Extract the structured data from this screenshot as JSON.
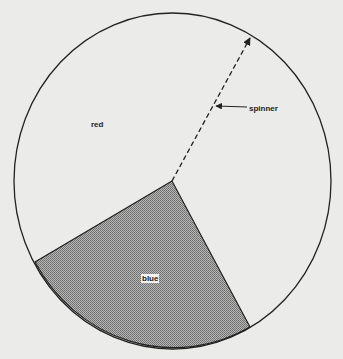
{
  "diagram": {
    "type": "spinner",
    "labels": {
      "red": "red",
      "blue": "blue",
      "spinner": "spinner"
    },
    "sectors": [
      {
        "name": "red",
        "fill": "#ebebe9"
      },
      {
        "name": "blue",
        "fill": "#9a9a9a",
        "pattern": "crosshatch"
      }
    ]
  }
}
